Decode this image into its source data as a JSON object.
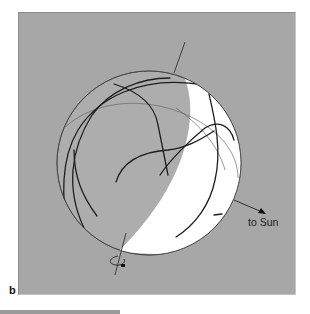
{
  "figure": {
    "panel_label": "b",
    "sun_direction_label": "to Sun",
    "colors": {
      "background": "#a7a7a7",
      "sphere_night_side": "#adadad",
      "sphere_day_side": "#ffffff",
      "lineament_stroke": "#1e1e1e",
      "grid_stroke": "#7a7a7a"
    },
    "elements": [
      "sphere",
      "terminator",
      "rotation-axis",
      "rotation-arrow",
      "equator-great-circle",
      "lineaments",
      "sun-direction-arrow"
    ]
  }
}
